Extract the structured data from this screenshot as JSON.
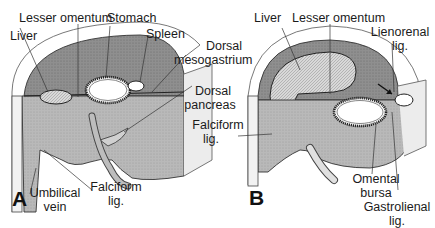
{
  "figure": {
    "type": "anatomical-diagram",
    "panels": [
      {
        "id": "A",
        "letter": "A",
        "labels": {
          "lesser_omentum": "Lesser omentum",
          "stomach": "Stomach",
          "liver": "Liver",
          "spleen": "Spleen",
          "dorsal_mesogastrium_1": "Dorsal",
          "dorsal_mesogastrium_2": "mesogastrium",
          "dorsal_pancreas_1": "Dorsal",
          "dorsal_pancreas_2": "pancreas",
          "umbilical_vein_1": "Umbilical",
          "umbilical_vein_2": "vein",
          "falciform_1": "Falciform",
          "falciform_2": "lig."
        }
      },
      {
        "id": "B",
        "letter": "B",
        "labels": {
          "liver": "Liver",
          "lesser_omentum": "Lesser omentum",
          "lienorenal_1": "Lienorenal",
          "lienorenal_2": "lig.",
          "falciform_1": "Falciform",
          "falciform_2": "lig.",
          "omental_bursa_1": "Omental",
          "omental_bursa_2": "bursa",
          "gastrolienal_1": "Gastrolienal",
          "gastrolienal_2": "lig."
        }
      }
    ],
    "colors": {
      "tissue_dark": "#6e6e6e",
      "tissue_mid": "#9a9a9a",
      "tissue_light": "#c4c4c4",
      "cavity_light": "#e6e6e6",
      "outline": "#2a2a2a",
      "background": "#ffffff"
    }
  }
}
